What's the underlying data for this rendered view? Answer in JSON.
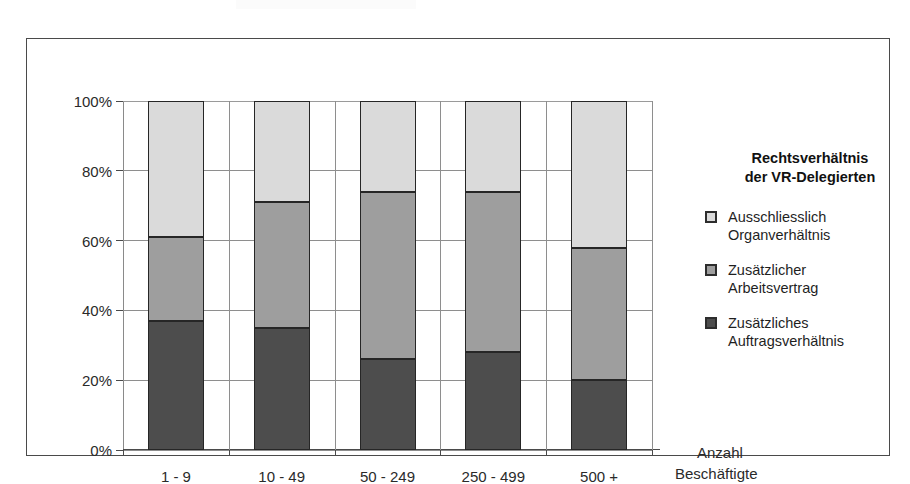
{
  "figure": {
    "scan_remnant": "",
    "axis_title": {
      "line1": "Anzahl",
      "line2": "Beschäftigte"
    }
  },
  "legend": {
    "title_line1": "Rechtsverhältnis",
    "title_line2": "der VR-Delegierten",
    "items": [
      {
        "label_line1": "Ausschliesslich",
        "label_line2": "Organverhältnis",
        "color": "#dadada"
      },
      {
        "label_line1": "Zusätzlicher",
        "label_line2": "Arbeitsvertrag",
        "color": "#9e9e9e"
      },
      {
        "label_line1": "Zusätzliches",
        "label_line2": "Auftragsverhältnis",
        "color": "#4d4d4d"
      }
    ]
  },
  "chart_data": {
    "type": "bar",
    "subtype": "stacked-100-percent",
    "title": "",
    "xlabel": "Anzahl Beschäftigte",
    "ylabel": "",
    "ylim": [
      0,
      100
    ],
    "yticks": [
      0,
      20,
      40,
      60,
      80,
      100
    ],
    "ytick_labels": [
      "0%",
      "20%",
      "40%",
      "60%",
      "80%",
      "100%"
    ],
    "grid": true,
    "legend_position": "right",
    "categories": [
      "1 - 9",
      "10 - 49",
      "50 - 249",
      "250 - 499",
      "500 +"
    ],
    "series": [
      {
        "name": "Zusätzliches Auftragsverhältnis",
        "color": "#4d4d4d",
        "values": [
          37,
          35,
          26,
          28,
          20
        ]
      },
      {
        "name": "Zusätzlicher Arbeitsvertrag",
        "color": "#9e9e9e",
        "values": [
          24,
          36,
          48,
          46,
          38
        ]
      },
      {
        "name": "Ausschliesslich Organverhältnis",
        "color": "#dadada",
        "values": [
          39,
          29,
          26,
          26,
          42
        ]
      }
    ],
    "cumulative_tops": {
      "dark": [
        37,
        35,
        26,
        28,
        20
      ],
      "mid": [
        61,
        71,
        74,
        74,
        58
      ],
      "light": [
        100,
        100,
        100,
        100,
        100
      ]
    }
  }
}
